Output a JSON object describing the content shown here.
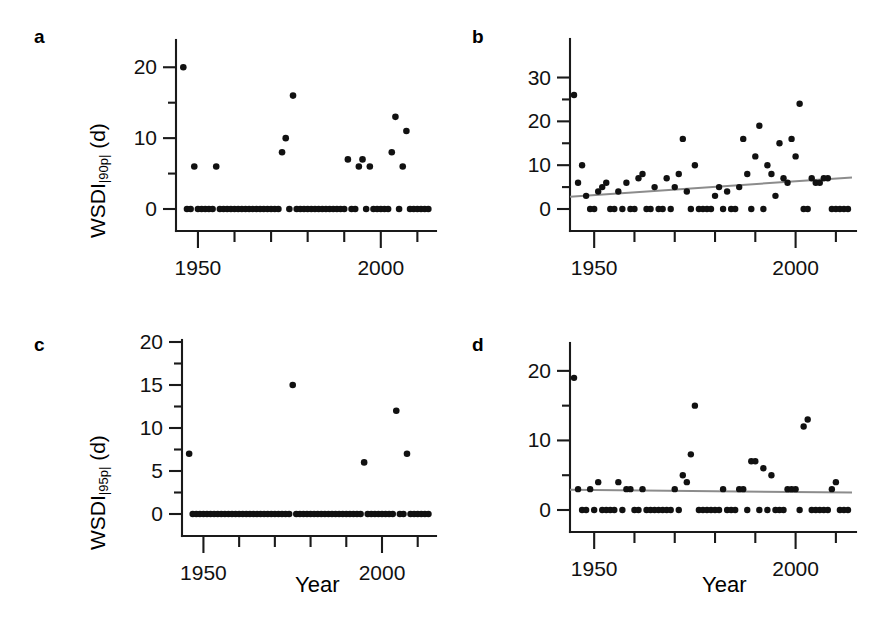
{
  "figure": {
    "width": 869,
    "height": 643,
    "background": "#ffffff",
    "point_color": "#111111",
    "axis_color": "#1a1a1a",
    "trend_color": "#8c8c8c",
    "xlabel": "Year",
    "panel_labels": [
      "a",
      "b",
      "c",
      "d"
    ]
  },
  "chart_data": [
    {
      "panel": "a",
      "type": "scatter",
      "title": "",
      "xlabel": "",
      "ylabel": "WSDI|90p| (d)",
      "ylabel_base": "WSDI",
      "ylabel_sub": "|90p|",
      "ylabel_unit": " (d)",
      "xlim": [
        1944,
        2014
      ],
      "ylim": [
        0,
        23
      ],
      "xticks_major": [
        1950,
        2000
      ],
      "xticks_minor": [
        1960,
        1970,
        1980,
        1990,
        2010
      ],
      "xticklabels": [
        "1950",
        "2000"
      ],
      "yticks_major": [
        0,
        10,
        20
      ],
      "yticks_minor": [
        5,
        15
      ],
      "yticklabels": [
        "0",
        "10",
        "20"
      ],
      "grid": false,
      "legend": false,
      "trendline": null,
      "x": [
        1946,
        1947,
        1948,
        1949,
        1950,
        1951,
        1952,
        1953,
        1954,
        1955,
        1956,
        1957,
        1958,
        1959,
        1960,
        1961,
        1962,
        1963,
        1964,
        1965,
        1966,
        1967,
        1968,
        1969,
        1970,
        1971,
        1972,
        1973,
        1974,
        1975,
        1976,
        1977,
        1978,
        1979,
        1980,
        1981,
        1982,
        1983,
        1984,
        1985,
        1986,
        1987,
        1988,
        1989,
        1990,
        1991,
        1992,
        1993,
        1994,
        1995,
        1996,
        1997,
        1998,
        1999,
        2000,
        2001,
        2002,
        2003,
        2004,
        2005,
        2006,
        2007,
        2008,
        2009,
        2010,
        2011,
        2012,
        2013
      ],
      "y": [
        20,
        0,
        0,
        6,
        0,
        0,
        0,
        0,
        0,
        6,
        0,
        0,
        0,
        0,
        0,
        0,
        0,
        0,
        0,
        0,
        0,
        0,
        0,
        0,
        0,
        0,
        0,
        8,
        10,
        0,
        16,
        0,
        0,
        0,
        0,
        0,
        0,
        0,
        0,
        0,
        0,
        0,
        0,
        0,
        0,
        7,
        0,
        0,
        6,
        7,
        0,
        6,
        0,
        0,
        0,
        0,
        0,
        8,
        13,
        0,
        6,
        11,
        0,
        0,
        0,
        0,
        0,
        0
      ]
    },
    {
      "panel": "b",
      "type": "scatter",
      "title": "",
      "xlabel": "",
      "ylabel": "",
      "xlim": [
        1944,
        2014
      ],
      "ylim": [
        0,
        34
      ],
      "xticks_major": [
        1950,
        2000
      ],
      "xticks_minor": [
        1960,
        1970,
        1980,
        1990,
        2010
      ],
      "xticklabels": [
        "1950",
        "2000"
      ],
      "yticks_major": [
        0,
        10,
        20,
        30
      ],
      "yticks_minor": [
        5,
        15,
        25
      ],
      "yticklabels": [
        "0",
        "10",
        "20",
        "30"
      ],
      "grid": false,
      "legend": false,
      "trendline": {
        "x": [
          1944,
          2014
        ],
        "y": [
          2.8,
          7.2
        ],
        "color": "#8c8c8c"
      },
      "x": [
        1945,
        1946,
        1947,
        1948,
        1949,
        1950,
        1951,
        1952,
        1953,
        1954,
        1955,
        1956,
        1957,
        1958,
        1959,
        1960,
        1961,
        1962,
        1963,
        1964,
        1965,
        1966,
        1967,
        1968,
        1969,
        1970,
        1971,
        1972,
        1973,
        1974,
        1975,
        1976,
        1977,
        1978,
        1979,
        1980,
        1981,
        1982,
        1983,
        1984,
        1985,
        1986,
        1987,
        1988,
        1989,
        1990,
        1991,
        1992,
        1993,
        1994,
        1995,
        1996,
        1997,
        1998,
        1999,
        2000,
        2001,
        2002,
        2003,
        2004,
        2005,
        2006,
        2007,
        2008,
        2009,
        2010,
        2011,
        2012,
        2013
      ],
      "y": [
        26,
        6,
        10,
        3,
        0,
        0,
        4,
        5,
        6,
        0,
        0,
        4,
        0,
        6,
        0,
        0,
        7,
        8,
        0,
        0,
        5,
        0,
        0,
        7,
        0,
        5,
        8,
        16,
        4,
        0,
        10,
        0,
        0,
        0,
        0,
        3,
        5,
        0,
        4,
        0,
        0,
        5,
        16,
        8,
        0,
        12,
        19,
        0,
        10,
        8,
        3,
        15,
        7,
        6,
        16,
        12,
        24,
        0,
        0,
        7,
        6,
        6,
        7,
        7,
        0,
        0,
        0,
        0,
        0
      ]
    },
    {
      "panel": "c",
      "type": "scatter",
      "title": "",
      "xlabel": "Year",
      "ylabel": "WSDI|95p| (d)",
      "ylabel_base": "WSDI",
      "ylabel_sub": "|95p|",
      "ylabel_unit": " (d)",
      "xlim": [
        1944,
        2014
      ],
      "ylim": [
        0,
        20
      ],
      "xticks_major": [
        1950,
        2000
      ],
      "xticks_minor": [
        1960,
        1970,
        1980,
        1990,
        2010
      ],
      "xticklabels": [
        "1950",
        "2000"
      ],
      "yticks_major": [
        0,
        5,
        10,
        15,
        20
      ],
      "yticks_minor": [
        2.5,
        7.5,
        12.5,
        17.5
      ],
      "yticklabels": [
        "0",
        "5",
        "10",
        "15",
        "20"
      ],
      "grid": false,
      "legend": false,
      "trendline": null,
      "x": [
        1946,
        1947,
        1948,
        1949,
        1950,
        1951,
        1952,
        1953,
        1954,
        1955,
        1956,
        1957,
        1958,
        1959,
        1960,
        1961,
        1962,
        1963,
        1964,
        1965,
        1966,
        1967,
        1968,
        1969,
        1970,
        1971,
        1972,
        1973,
        1974,
        1975,
        1976,
        1977,
        1978,
        1979,
        1980,
        1981,
        1982,
        1983,
        1984,
        1985,
        1986,
        1987,
        1988,
        1989,
        1990,
        1991,
        1992,
        1993,
        1994,
        1995,
        1996,
        1997,
        1998,
        1999,
        2000,
        2001,
        2002,
        2003,
        2004,
        2005,
        2006,
        2007,
        2008,
        2009,
        2010,
        2011,
        2012,
        2013
      ],
      "y": [
        7,
        0,
        0,
        0,
        0,
        0,
        0,
        0,
        0,
        0,
        0,
        0,
        0,
        0,
        0,
        0,
        0,
        0,
        0,
        0,
        0,
        0,
        0,
        0,
        0,
        0,
        0,
        0,
        0,
        15,
        0,
        0,
        0,
        0,
        0,
        0,
        0,
        0,
        0,
        0,
        0,
        0,
        0,
        0,
        0,
        0,
        0,
        0,
        0,
        6,
        0,
        0,
        0,
        0,
        0,
        0,
        0,
        0,
        12,
        0,
        0,
        7,
        0,
        0,
        0,
        0,
        0,
        0
      ]
    },
    {
      "panel": "d",
      "type": "scatter",
      "title": "",
      "xlabel": "Year",
      "ylabel": "",
      "xlim": [
        1944,
        2014
      ],
      "ylim": [
        0,
        23
      ],
      "xticks_major": [
        1950,
        2000
      ],
      "xticks_minor": [
        1960,
        1970,
        1980,
        1990,
        2010
      ],
      "xticklabels": [
        "1950",
        "2000"
      ],
      "yticks_major": [
        0,
        10,
        20
      ],
      "yticks_minor": [
        5,
        15
      ],
      "yticklabels": [
        "0",
        "10",
        "20"
      ],
      "grid": false,
      "legend": false,
      "trendline": {
        "x": [
          1944,
          2014
        ],
        "y": [
          2.9,
          2.5
        ],
        "color": "#8c8c8c"
      },
      "x": [
        1945,
        1946,
        1947,
        1948,
        1949,
        1950,
        1951,
        1952,
        1953,
        1954,
        1955,
        1956,
        1957,
        1958,
        1959,
        1960,
        1961,
        1962,
        1963,
        1964,
        1965,
        1966,
        1967,
        1968,
        1969,
        1970,
        1971,
        1972,
        1973,
        1974,
        1975,
        1976,
        1977,
        1978,
        1979,
        1980,
        1981,
        1982,
        1983,
        1984,
        1985,
        1986,
        1987,
        1988,
        1989,
        1990,
        1991,
        1992,
        1993,
        1994,
        1995,
        1996,
        1997,
        1998,
        1999,
        2000,
        2001,
        2002,
        2003,
        2004,
        2005,
        2006,
        2007,
        2008,
        2009,
        2010,
        2011,
        2012,
        2013
      ],
      "y": [
        19,
        3,
        0,
        0,
        3,
        0,
        4,
        0,
        0,
        0,
        0,
        4,
        0,
        3,
        3,
        0,
        0,
        3,
        0,
        0,
        0,
        0,
        0,
        0,
        0,
        3,
        0,
        5,
        4,
        8,
        15,
        0,
        0,
        0,
        0,
        0,
        0,
        3,
        0,
        0,
        0,
        3,
        3,
        0,
        7,
        7,
        0,
        6,
        0,
        5,
        0,
        0,
        0,
        3,
        3,
        3,
        0,
        12,
        13,
        0,
        0,
        0,
        0,
        0,
        3,
        4,
        0,
        0,
        0
      ]
    }
  ]
}
